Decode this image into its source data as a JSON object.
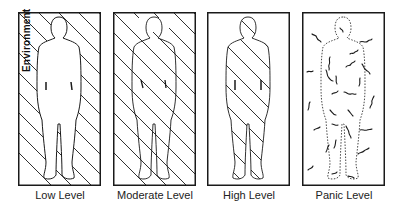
{
  "figure": {
    "side_label": "Environment",
    "panels": [
      {
        "id": "low",
        "label": "Low Level"
      },
      {
        "id": "moderate",
        "label": "Moderate Level"
      },
      {
        "id": "high",
        "label": "High Level"
      },
      {
        "id": "panic",
        "label": "Panic Level"
      }
    ]
  },
  "colors": {
    "ink": "#1a1a1a",
    "background": "#ffffff"
  }
}
